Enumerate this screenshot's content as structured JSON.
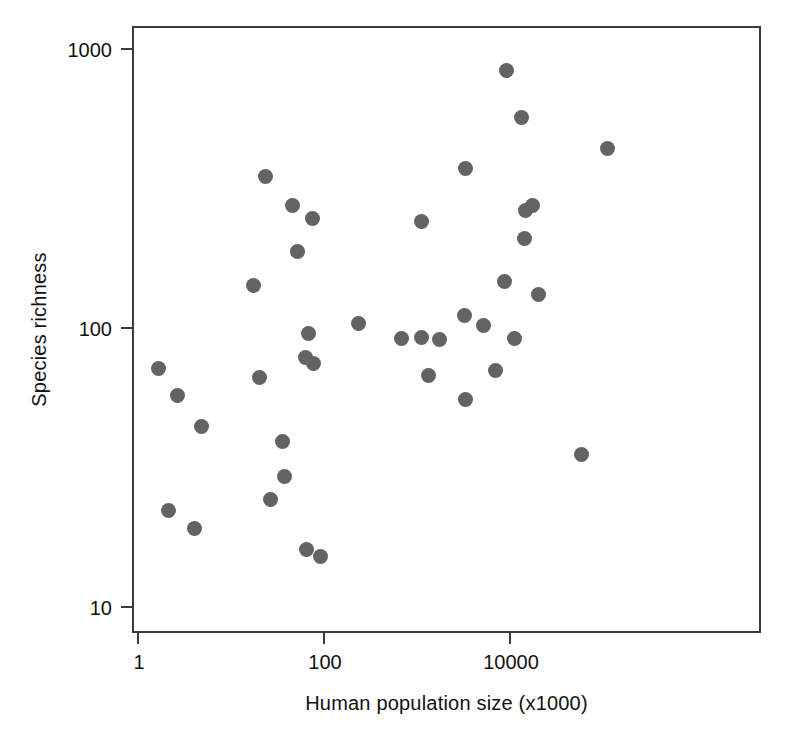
{
  "chart_data": {
    "type": "scatter",
    "title": "",
    "xlabel": "Human population size (x1000)",
    "ylabel": "Species richness",
    "xscale": "log",
    "yscale": "log",
    "xlim": [
      1,
      150000
    ],
    "ylim": [
      9,
      1200
    ],
    "grid": false,
    "legend": null,
    "marker": {
      "shape": "circle",
      "color": "#636363",
      "size_px": 15
    },
    "xticks": [
      {
        "value": 1,
        "label": "1"
      },
      {
        "value": 100,
        "label": "100"
      },
      {
        "value": 10000,
        "label": "10000"
      }
    ],
    "yticks": [
      {
        "value": 10,
        "label": "10"
      },
      {
        "value": 100,
        "label": "100"
      },
      {
        "value": 1000,
        "label": "1000"
      }
    ],
    "points": [
      {
        "x": 1.7,
        "y": 71
      },
      {
        "x": 2.7,
        "y": 57
      },
      {
        "x": 4.9,
        "y": 44
      },
      {
        "x": 2.2,
        "y": 22
      },
      {
        "x": 4.2,
        "y": 19
      },
      {
        "x": 21,
        "y": 66
      },
      {
        "x": 27,
        "y": 24
      },
      {
        "x": 18,
        "y": 141
      },
      {
        "x": 39,
        "y": 29
      },
      {
        "x": 37,
        "y": 39
      },
      {
        "x": 24,
        "y": 345
      },
      {
        "x": 47,
        "y": 272
      },
      {
        "x": 78,
        "y": 245
      },
      {
        "x": 53,
        "y": 187
      },
      {
        "x": 70,
        "y": 95
      },
      {
        "x": 65,
        "y": 78
      },
      {
        "x": 79,
        "y": 74
      },
      {
        "x": 67,
        "y": 16
      },
      {
        "x": 95,
        "y": 15
      },
      {
        "x": 240,
        "y": 103
      },
      {
        "x": 700,
        "y": 91
      },
      {
        "x": 1150,
        "y": 92
      },
      {
        "x": 1800,
        "y": 90
      },
      {
        "x": 1350,
        "y": 67
      },
      {
        "x": 1150,
        "y": 238
      },
      {
        "x": 3400,
        "y": 55
      },
      {
        "x": 3400,
        "y": 371
      },
      {
        "x": 3300,
        "y": 110
      },
      {
        "x": 5300,
        "y": 101
      },
      {
        "x": 7200,
        "y": 70
      },
      {
        "x": 9000,
        "y": 145
      },
      {
        "x": 11500,
        "y": 91
      },
      {
        "x": 9500,
        "y": 830
      },
      {
        "x": 13500,
        "y": 565
      },
      {
        "x": 15000,
        "y": 261
      },
      {
        "x": 18000,
        "y": 272
      },
      {
        "x": 14500,
        "y": 208
      },
      {
        "x": 21000,
        "y": 131
      },
      {
        "x": 60000,
        "y": 35
      },
      {
        "x": 115000,
        "y": 437
      }
    ]
  }
}
